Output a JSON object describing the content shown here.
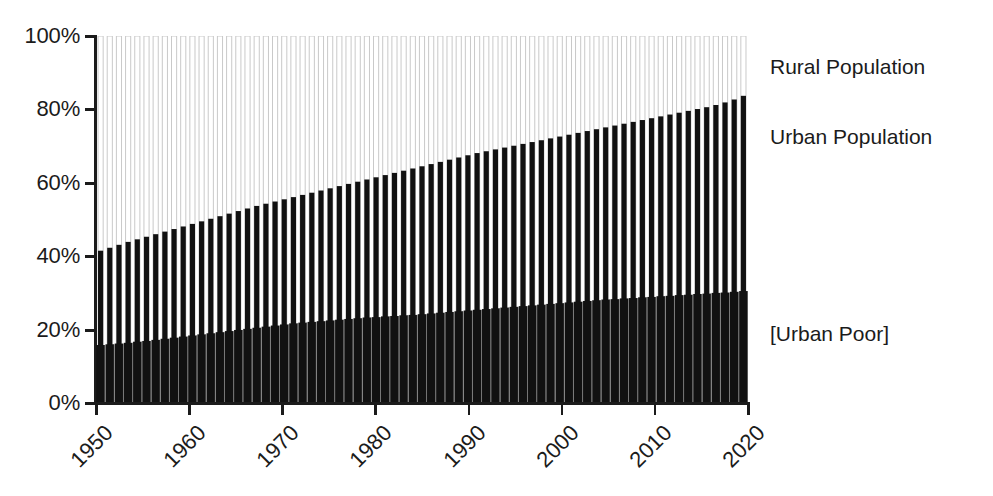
{
  "chart_data": {
    "type": "bar",
    "title": "",
    "subtitle": "",
    "xlabel": "",
    "ylabel": "",
    "xlim": [
      1950,
      2020
    ],
    "ylim": [
      0,
      100
    ],
    "grid": false,
    "legend_position": "right-inline",
    "stacked": true,
    "y_tick_labels": [
      "100%",
      "80%",
      "60%",
      "40%",
      "20%",
      "0%"
    ],
    "y_tick_values": [
      100,
      80,
      60,
      40,
      20,
      0
    ],
    "x_tick_labels": [
      "1950",
      "1960",
      "1970",
      "1980",
      "1990",
      "2000",
      "2010",
      "2020"
    ],
    "x_tick_values": [
      1950,
      1960,
      1970,
      1980,
      1990,
      2000,
      2010,
      2020
    ],
    "series": [
      {
        "name": "Urban Poor",
        "label": "[Urban Poor]",
        "color": "#111111",
        "fill": "solid-black",
        "values": [
          15.8,
          16.0,
          16.2,
          16.4,
          16.7,
          16.9,
          17.2,
          17.5,
          17.8,
          18.1,
          18.4,
          18.7,
          19.0,
          19.3,
          19.6,
          19.9,
          20.2,
          20.5,
          20.8,
          21.1,
          21.4,
          21.7,
          21.9,
          22.1,
          22.3,
          22.5,
          22.7,
          22.9,
          23.1,
          23.3,
          23.4,
          23.6,
          23.7,
          23.9,
          24.0,
          24.2,
          24.4,
          24.6,
          24.8,
          25.0,
          25.2,
          25.4,
          25.6,
          25.8,
          26.0,
          26.2,
          26.4,
          26.6,
          26.8,
          27.0,
          27.2,
          27.4,
          27.6,
          27.8,
          28.0,
          28.2,
          28.3,
          28.5,
          28.6,
          28.8,
          28.9,
          29.1,
          29.2,
          29.4,
          29.5,
          29.7,
          29.8,
          30.0,
          30.1,
          30.3,
          30.5
        ]
      },
      {
        "name": "Urban Population",
        "label": "Urban Population",
        "color": "#111111",
        "fill": "black-bar",
        "values": [
          41.5,
          42.3,
          43.1,
          43.9,
          44.6,
          45.3,
          46.0,
          46.7,
          47.4,
          48.1,
          48.8,
          49.5,
          50.2,
          50.9,
          51.6,
          52.3,
          53.0,
          53.7,
          54.3,
          54.9,
          55.5,
          56.1,
          56.7,
          57.3,
          57.9,
          58.5,
          59.1,
          59.7,
          60.3,
          60.9,
          61.5,
          62.1,
          62.7,
          63.3,
          63.9,
          64.5,
          65.1,
          65.7,
          66.3,
          66.9,
          67.5,
          68.1,
          68.6,
          69.1,
          69.6,
          70.1,
          70.6,
          71.1,
          71.6,
          72.1,
          72.6,
          73.1,
          73.6,
          74.1,
          74.6,
          75.1,
          75.6,
          76.1,
          76.6,
          77.1,
          77.6,
          78.1,
          78.6,
          79.1,
          79.6,
          80.1,
          80.6,
          81.2,
          81.9,
          82.7,
          83.7
        ]
      },
      {
        "name": "Rural Population",
        "label": "Rural Population",
        "color": "#ffffff",
        "fill": "white-bar-outline",
        "values": [
          100,
          100,
          100,
          100,
          100,
          100,
          100,
          100,
          100,
          100,
          100,
          100,
          100,
          100,
          100,
          100,
          100,
          100,
          100,
          100,
          100,
          100,
          100,
          100,
          100,
          100,
          100,
          100,
          100,
          100,
          100,
          100,
          100,
          100,
          100,
          100,
          100,
          100,
          100,
          100,
          100,
          100,
          100,
          100,
          100,
          100,
          100,
          100,
          100,
          100,
          100,
          100,
          100,
          100,
          100,
          100,
          100,
          100,
          100,
          100,
          100,
          100,
          100,
          100,
          100,
          100,
          100,
          100,
          100,
          100,
          100
        ]
      }
    ],
    "x": [
      1950,
      1951,
      1952,
      1953,
      1954,
      1955,
      1956,
      1957,
      1958,
      1959,
      1960,
      1961,
      1962,
      1963,
      1964,
      1965,
      1966,
      1967,
      1968,
      1969,
      1970,
      1971,
      1972,
      1973,
      1974,
      1975,
      1976,
      1977,
      1978,
      1979,
      1980,
      1981,
      1982,
      1983,
      1984,
      1985,
      1986,
      1987,
      1988,
      1989,
      1990,
      1991,
      1992,
      1993,
      1994,
      1995,
      1996,
      1997,
      1998,
      1999,
      2000,
      2001,
      2002,
      2003,
      2004,
      2005,
      2006,
      2007,
      2008,
      2009,
      2010,
      2011,
      2012,
      2013,
      2014,
      2015,
      2016,
      2017,
      2018,
      2019,
      2020
    ]
  },
  "labels": {
    "rural": "Rural Population",
    "urban": "Urban Population",
    "urban_poor": "[Urban Poor]"
  },
  "colors": {
    "ink": "#1b1b1b",
    "bar_fill": "#111111",
    "outline": "#c9c9c9",
    "background": "#ffffff"
  }
}
